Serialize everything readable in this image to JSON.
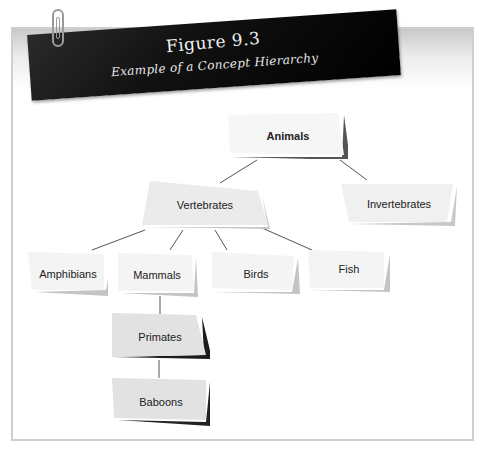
{
  "figure": {
    "number_label": "Figure 9.3",
    "caption": "Example of a Concept Hierarchy"
  },
  "diagram": {
    "type": "concept-hierarchy",
    "nodes": [
      {
        "id": "animals",
        "label": "Animals",
        "level": 0,
        "bold": true
      },
      {
        "id": "vertebrates",
        "label": "Vertebrates",
        "level": 1,
        "parent": "animals"
      },
      {
        "id": "invertebrates",
        "label": "Invertebrates",
        "level": 1,
        "parent": "animals"
      },
      {
        "id": "amphibians",
        "label": "Amphibians",
        "level": 2,
        "parent": "vertebrates"
      },
      {
        "id": "mammals",
        "label": "Mammals",
        "level": 2,
        "parent": "vertebrates"
      },
      {
        "id": "birds",
        "label": "Birds",
        "level": 2,
        "parent": "vertebrates"
      },
      {
        "id": "fish",
        "label": "Fish",
        "level": 2,
        "parent": "vertebrates"
      },
      {
        "id": "primates",
        "label": "Primates",
        "level": 3,
        "parent": "mammals"
      },
      {
        "id": "baboons",
        "label": "Baboons",
        "level": 4,
        "parent": "primates"
      }
    ]
  },
  "colors": {
    "banner": "#000000",
    "node_fill_light": "#f4f4f4",
    "node_fill_gray": "#e2e2e2",
    "node_shadow_gray": "#b9b9b9",
    "node_shadow_dark": "#222222",
    "line": "#555555"
  }
}
